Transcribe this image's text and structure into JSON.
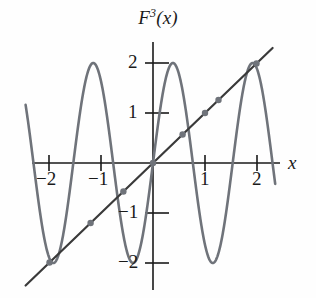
{
  "figure": {
    "title_base": "F",
    "title_exponent": "3",
    "title_arg": "(x)",
    "title_full": "F^3(x)",
    "axis_label_x": "x",
    "colors": {
      "curve": "#6f737a",
      "line": "#3a3a3a",
      "axis": "#1a1a1a",
      "dot": "#6f737a",
      "background": "#fefefe",
      "text": "#1a1a1a"
    }
  },
  "axes": {
    "x_ticks": [
      {
        "value": -2,
        "label": "−2"
      },
      {
        "value": -1,
        "label": "−1"
      },
      {
        "value": 1,
        "label": "1"
      },
      {
        "value": 2,
        "label": "2"
      }
    ],
    "y_ticks": [
      {
        "value": 2,
        "label": "2"
      },
      {
        "value": 1,
        "label": "1"
      },
      {
        "value": -1,
        "label": "−1"
      },
      {
        "value": -2,
        "label": "−2"
      }
    ],
    "xlim": [
      -2.45,
      2.35
    ],
    "ylim": [
      -2.6,
      2.45
    ],
    "origin_px": [
      153,
      163
    ],
    "unit_px": [
      52,
      50
    ]
  },
  "chart_data": {
    "type": "line",
    "xlabel": "x",
    "ylabel": "",
    "xlim": [
      -2.45,
      2.35
    ],
    "ylim": [
      -2.6,
      2.45
    ],
    "grid": false,
    "legend": "none",
    "series": [
      {
        "name": "F^3(x)",
        "type": "line",
        "color": "#6f737a",
        "description": "high-frequency oscillation, amplitude 2",
        "amplitude": 2,
        "approx_formula": "2*sin(4.1*x + 0.0)",
        "peaks_x": [
          -1.47,
          0.0,
          1.52
        ],
        "peaks_y": [
          2,
          2,
          2
        ],
        "troughs_x": [
          -2.25,
          -0.77,
          0.77,
          1.83
        ],
        "troughs_y": [
          -2,
          -2,
          -2,
          -2
        ],
        "zeros_x": [
          -1.86,
          -1.09,
          -0.38,
          0.38,
          1.09,
          1.86
        ]
      },
      {
        "name": "y = x",
        "type": "line",
        "color": "#3a3a3a",
        "slope": 1,
        "intercept": 0,
        "x_start": -2.45,
        "x_end": 2.3
      }
    ],
    "intersections": [
      {
        "x": -1.99,
        "y": -1.99
      },
      {
        "x": -1.2,
        "y": -1.2
      },
      {
        "x": -0.57,
        "y": -0.57
      },
      {
        "x": 0.0,
        "y": 0.0
      },
      {
        "x": 0.57,
        "y": 0.57
      },
      {
        "x": 1.0,
        "y": 1.0
      },
      {
        "x": 1.26,
        "y": 1.26
      },
      {
        "x": 1.99,
        "y": 1.99
      }
    ]
  }
}
